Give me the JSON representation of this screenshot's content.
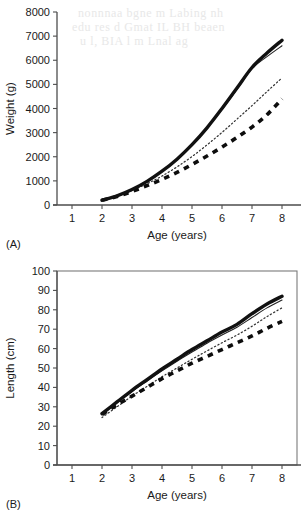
{
  "figure": {
    "panels": [
      {
        "tag": "(A)",
        "xlabel": "Age (years)",
        "ylabel": "Weight (g)"
      },
      {
        "tag": "(B)",
        "xlabel": "Age (years)",
        "ylabel": "Length (cm)"
      }
    ]
  },
  "chart_data": [
    {
      "type": "line",
      "panel": "(A)",
      "title": "",
      "xlabel": "Age (years)",
      "ylabel": "Weight (g)",
      "xlim": [
        0.5,
        8.5
      ],
      "ylim": [
        0,
        8000
      ],
      "xticks": [
        1,
        2,
        3,
        4,
        5,
        6,
        7,
        8
      ],
      "yticks": [
        0,
        1000,
        2000,
        3000,
        4000,
        5000,
        6000,
        7000,
        8000
      ],
      "xticklabels": [
        "1",
        "2",
        "3",
        "4",
        "5",
        "6",
        "7",
        "8"
      ],
      "yticklabels": [
        "0",
        "1000",
        "2000",
        "3000",
        "4000",
        "5000",
        "6000",
        "7000",
        "8000"
      ],
      "grid": false,
      "legend": "none",
      "x": [
        2,
        2.5,
        3,
        3.5,
        4,
        4.5,
        5,
        5.5,
        6,
        6.5,
        7,
        7.5,
        8
      ],
      "series": [
        {
          "name": "thick-solid",
          "style": "thick-solid",
          "values": [
            200,
            380,
            640,
            980,
            1400,
            1900,
            2500,
            3200,
            4000,
            4850,
            5700,
            6300,
            6830
          ]
        },
        {
          "name": "thin-solid",
          "style": "thin-solid",
          "values": [
            200,
            380,
            635,
            970,
            1385,
            1880,
            2470,
            3170,
            3960,
            4800,
            5650,
            6150,
            6600
          ]
        },
        {
          "name": "dotted",
          "style": "dotted",
          "values": [
            200,
            360,
            600,
            880,
            1200,
            1580,
            2010,
            2490,
            3010,
            3560,
            4120,
            4700,
            5270
          ]
        },
        {
          "name": "thick-dashed",
          "style": "thick-dashed",
          "values": [
            200,
            350,
            560,
            800,
            1060,
            1350,
            1680,
            2030,
            2400,
            2800,
            3230,
            3740,
            4400
          ]
        }
      ]
    },
    {
      "type": "line",
      "panel": "(B)",
      "title": "",
      "xlabel": "Age (years)",
      "ylabel": "Length (cm)",
      "xlim": [
        0.5,
        8.5
      ],
      "ylim": [
        0,
        100
      ],
      "xticks": [
        1,
        2,
        3,
        4,
        5,
        6,
        7,
        8
      ],
      "yticks": [
        0,
        10,
        20,
        30,
        40,
        50,
        60,
        70,
        80,
        90,
        100
      ],
      "xticklabels": [
        "1",
        "2",
        "3",
        "4",
        "5",
        "6",
        "7",
        "8"
      ],
      "yticklabels": [
        "0",
        "10",
        "20",
        "30",
        "40",
        "50",
        "60",
        "70",
        "80",
        "90",
        "100"
      ],
      "grid": false,
      "legend": "none",
      "x": [
        2,
        2.5,
        3,
        3.5,
        4,
        4.5,
        5,
        5.5,
        6,
        6.5,
        7,
        7.5,
        8
      ],
      "series": [
        {
          "name": "thick-solid",
          "style": "thick-solid",
          "values": [
            26.5,
            32.5,
            38.5,
            44.0,
            49.5,
            54.5,
            59.5,
            64.0,
            68.5,
            72.5,
            78.0,
            83.0,
            87.0
          ]
        },
        {
          "name": "thin-solid",
          "style": "thin-solid",
          "values": [
            26.0,
            32.0,
            37.8,
            43.2,
            48.5,
            53.5,
            58.2,
            62.8,
            67.0,
            71.0,
            76.0,
            81.0,
            85.0
          ]
        },
        {
          "name": "dotted",
          "style": "dotted",
          "values": [
            24.5,
            30.0,
            35.5,
            40.5,
            45.5,
            50.0,
            54.5,
            58.8,
            63.0,
            67.0,
            71.5,
            76.5,
            81.0
          ]
        },
        {
          "name": "thick-dashed",
          "style": "thick-dashed",
          "values": [
            26.0,
            31.0,
            35.5,
            40.0,
            44.5,
            48.5,
            52.5,
            56.0,
            59.5,
            63.0,
            66.5,
            70.5,
            74.0
          ]
        }
      ]
    }
  ],
  "bleed_through": [
    "nonnnaa bgne m Labing nh",
    "edu res d Gmat IL BH  beaen",
    "u l,  BIA l  m   Lnal ag"
  ]
}
